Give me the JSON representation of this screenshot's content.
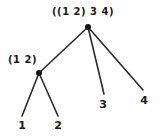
{
  "diagram": {
    "type": "tree",
    "title_label": "((1 2) 3 4)",
    "colors": {
      "background": "#ffffff",
      "ink": "#1a1a1a",
      "edge": "#2b2b2b",
      "node": "#141414"
    },
    "nodes": [
      {
        "id": "root",
        "label": "((1 2) 3 4)",
        "x": 88,
        "y": 27,
        "label_x": 52,
        "label_y": 7,
        "kind": "internal"
      },
      {
        "id": "left",
        "label": "(1 2)",
        "x": 39,
        "y": 73,
        "label_x": 8,
        "label_y": 55,
        "kind": "internal"
      }
    ],
    "leaves": [
      {
        "id": "leaf-1",
        "label": "1",
        "x": 22,
        "y": 125,
        "tip_x": 22,
        "tip_y": 116
      },
      {
        "id": "leaf-2",
        "label": "2",
        "x": 58,
        "y": 125,
        "tip_x": 58,
        "tip_y": 116
      },
      {
        "id": "leaf-3",
        "label": "3",
        "x": 103,
        "y": 104,
        "tip_x": 104,
        "tip_y": 94
      },
      {
        "id": "leaf-4",
        "label": "4",
        "x": 144,
        "y": 100,
        "tip_x": 143,
        "tip_y": 90
      }
    ],
    "edges": [
      {
        "id": "edge-root-left",
        "from": "root",
        "to": "left",
        "x1": 88,
        "y1": 27,
        "x2": 39,
        "y2": 73
      },
      {
        "id": "edge-root-leaf3",
        "from": "root",
        "to": "leaf-3",
        "x1": 88,
        "y1": 27,
        "x2": 104,
        "y2": 94
      },
      {
        "id": "edge-root-leaf4",
        "from": "root",
        "to": "leaf-4",
        "x1": 88,
        "y1": 27,
        "x2": 143,
        "y2": 90
      },
      {
        "id": "edge-left-leaf1",
        "from": "left",
        "to": "leaf-1",
        "x1": 39,
        "y1": 73,
        "x2": 22,
        "y2": 116
      },
      {
        "id": "edge-left-leaf2",
        "from": "left",
        "to": "leaf-2",
        "x1": 39,
        "y1": 73,
        "x2": 58,
        "y2": 116
      }
    ]
  }
}
